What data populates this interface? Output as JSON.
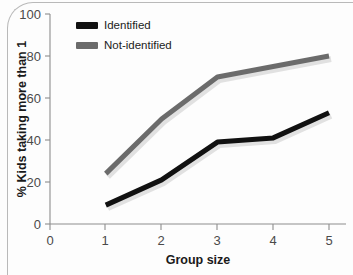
{
  "chart_data": {
    "type": "line",
    "title": "",
    "subtitle": "",
    "xlabel": "Group size",
    "ylabel": "% Kids taking more than 1",
    "x": [
      1,
      2,
      3,
      4,
      5
    ],
    "xlim": [
      0,
      5
    ],
    "ylim": [
      0,
      100
    ],
    "x_ticks": [
      "0",
      "1",
      "2",
      "3",
      "4",
      "5"
    ],
    "y_ticks": [
      "0",
      "20",
      "40",
      "60",
      "80",
      "100"
    ],
    "grid": false,
    "legend_position": "top-left-inside",
    "series": [
      {
        "name": "Identified",
        "color": "#111111",
        "values": [
          9,
          21,
          39,
          41,
          53
        ]
      },
      {
        "name": "Not-identified",
        "color": "#6b6b6b",
        "values": [
          24,
          50,
          70,
          75,
          80
        ]
      }
    ],
    "annotations": []
  },
  "legend": {
    "items": [
      {
        "label": "Identified",
        "swatch_color": "#111111"
      },
      {
        "label": "Not-identified",
        "swatch_color": "#6b6b6b"
      }
    ]
  },
  "axes": {
    "x_title": "Group size",
    "y_title": "% Kids taking more than 1",
    "x_tick_labels": [
      "0",
      "1",
      "2",
      "3",
      "4",
      "5"
    ],
    "y_tick_labels": [
      "0",
      "20",
      "40",
      "60",
      "80",
      "100"
    ]
  },
  "colors": {
    "background": "#fdfdfd",
    "axis": "#8d8d8d",
    "text": "#1a1a1a",
    "tick_text": "#4a4a4a",
    "series_identified": "#111111",
    "series_not_identified": "#6b6b6b",
    "page_border": "#b9b9b9"
  }
}
